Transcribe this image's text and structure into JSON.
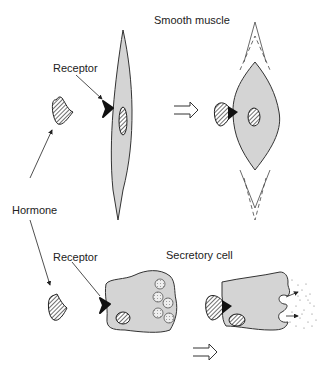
{
  "labels": {
    "smooth_muscle": "Smooth muscle",
    "receptor_top": "Receptor",
    "hormone": "Hormone",
    "receptor_bottom": "Receptor",
    "secretory_cell": "Secretory cell"
  },
  "colors": {
    "cell_fill": "#d4d4d4",
    "outline": "#333333",
    "receptor": "#111111",
    "background": "#ffffff"
  },
  "icons": {
    "transition_arrow": "open-double-arrow-right"
  }
}
